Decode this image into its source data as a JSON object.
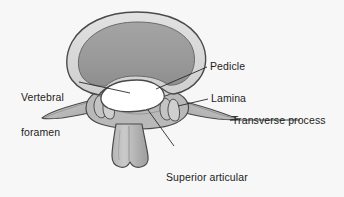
{
  "figure": {
    "background_color": "#f7f7f7",
    "outline_color": "#4a4a4a",
    "cortical_rim_color": "#d8d8d8",
    "vertebral_body_color": "#9a9a9a",
    "vertebral_foramen_color": "#ffffff",
    "process_color": "#bdbdbd",
    "process_shade_color": "#a6a6a6",
    "leader_line_color": "#2a2a2a",
    "text_color": "#1c1c1c"
  },
  "labels": {
    "vertebral_foramen": "Vertebral\nforamen",
    "vertebral_foramen_line1": "Vertebral",
    "vertebral_foramen_line2": "foramen",
    "pedicle": "Pedicle",
    "lamina": "Lamina",
    "transverse_process": "Transverse process",
    "superior_articular_process_line1": "Superior articular",
    "superior_articular_process_line2": "process"
  },
  "parts": [
    {
      "name": "vertebral-body",
      "label": "Vertebral body"
    },
    {
      "name": "vertebral-foramen",
      "label": "Vertebral foramen"
    },
    {
      "name": "pedicle",
      "label": "Pedicle"
    },
    {
      "name": "lamina",
      "label": "Lamina"
    },
    {
      "name": "transverse-process-left",
      "label": "Transverse process"
    },
    {
      "name": "transverse-process-right",
      "label": "Transverse process"
    },
    {
      "name": "superior-articular-process",
      "label": "Superior articular process"
    },
    {
      "name": "spinous-process",
      "label": "Spinous process"
    }
  ]
}
